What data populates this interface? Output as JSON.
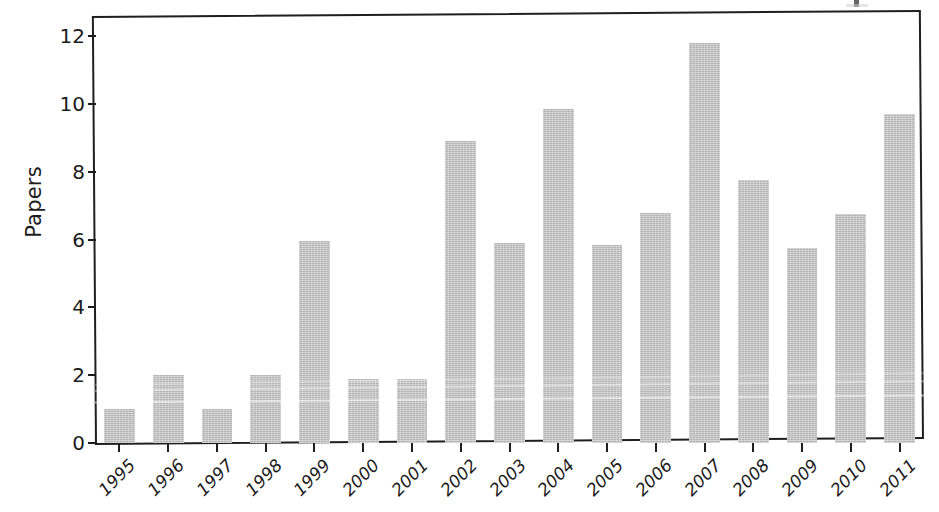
{
  "figure": {
    "background_color": "#ffffff",
    "frame_color": "#1f1f1f",
    "bar_color": "#c2c2c2",
    "text_color": "#1c1c1c"
  },
  "axis": {
    "y_label": "Papers",
    "y_ticks": [
      "0",
      "2",
      "4",
      "6",
      "8",
      "10",
      "12"
    ],
    "x_ticks": [
      "1995",
      "1996",
      "1997",
      "1998",
      "1999",
      "2000",
      "2001",
      "2002",
      "2003",
      "2004",
      "2005",
      "2006",
      "2007",
      "2008",
      "2009",
      "2010",
      "2011"
    ]
  },
  "chart_data": {
    "type": "bar",
    "title": "",
    "subtitle": "",
    "xlabel": "",
    "ylabel": "Papers",
    "categories": [
      "1995",
      "1996",
      "1997",
      "1998",
      "1999",
      "2000",
      "2001",
      "2002",
      "2003",
      "2004",
      "2005",
      "2006",
      "2007",
      "2008",
      "2009",
      "2010",
      "2011"
    ],
    "values": [
      1.0,
      2.0,
      1.0,
      2.0,
      5.95,
      1.9,
      1.9,
      8.9,
      5.9,
      9.85,
      5.85,
      6.8,
      11.8,
      7.75,
      5.75,
      6.75,
      9.7
    ],
    "ylim": [
      0,
      12.6
    ],
    "ytick_values": [
      0,
      2,
      4,
      6,
      8,
      10,
      12
    ],
    "grid": false,
    "legend": "none",
    "bar_color": "#c2c2c2",
    "series": [
      {
        "name": "Papers",
        "values": [
          1.0,
          2.0,
          1.0,
          2.0,
          5.95,
          1.9,
          1.9,
          8.9,
          5.9,
          9.85,
          5.85,
          6.8,
          11.8,
          7.75,
          5.75,
          6.75,
          9.7
        ]
      }
    ]
  }
}
